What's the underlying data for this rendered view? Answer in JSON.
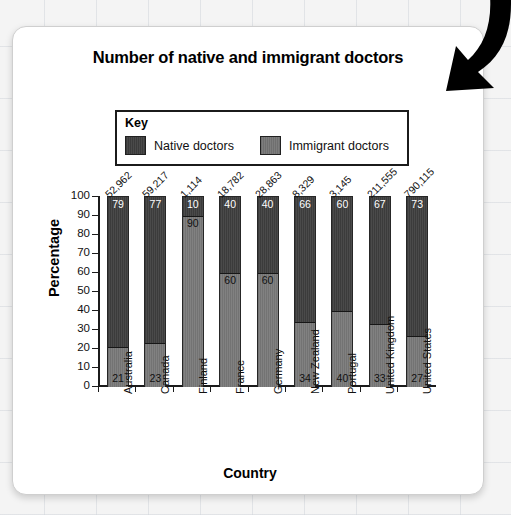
{
  "chart_data": {
    "type": "bar",
    "subtype": "stacked-percentage",
    "title": "Number of native and immigrant doctors",
    "xlabel": "Country",
    "ylabel": "Percentage",
    "ylim": [
      0,
      100
    ],
    "ytick_step": 10,
    "yticks": [
      0,
      10,
      20,
      30,
      40,
      50,
      60,
      70,
      80,
      90,
      100
    ],
    "grid": false,
    "legend_position": "top-center",
    "legend_title": "Key",
    "categories": [
      "Australia",
      "Canada",
      "Finland",
      "France",
      "Germany",
      "New Zealand",
      "Portugal",
      "United Kingdom",
      "United States"
    ],
    "totals": [
      "52,962",
      "59,217",
      "1,114",
      "18,782",
      "28,863",
      "8,329",
      "3,145",
      "211,555",
      "790,115"
    ],
    "series": [
      {
        "name": "Native doctors",
        "color": "#3f3f3f",
        "values": [
          79,
          77,
          10,
          40,
          40,
          66,
          60,
          67,
          73
        ]
      },
      {
        "name": "Immigrant doctors",
        "color": "#787878",
        "values": [
          21,
          23,
          90,
          60,
          60,
          34,
          40,
          33,
          27
        ]
      }
    ]
  },
  "annotations": {
    "arrow": "curved-down-left-arrow"
  }
}
